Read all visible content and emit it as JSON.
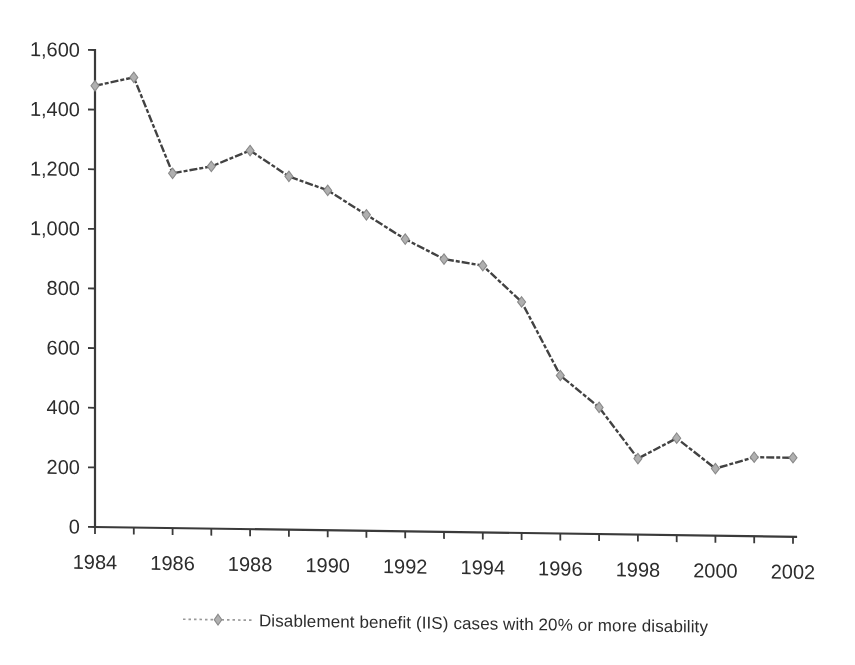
{
  "chart_data": {
    "type": "line",
    "x": [
      1984,
      1985,
      1986,
      1987,
      1988,
      1989,
      1990,
      1991,
      1992,
      1993,
      1994,
      1995,
      1996,
      1997,
      1998,
      1999,
      2000,
      2001,
      2002
    ],
    "series": [
      {
        "name": "Disablement benefit (IIS) cases with 20% or more disability",
        "values": [
          1480,
          1510,
          1190,
          1215,
          1270,
          1185,
          1140,
          1060,
          980,
          915,
          895,
          775,
          530,
          425,
          255,
          325,
          225,
          265,
          265
        ]
      }
    ],
    "xlabel": "",
    "ylabel": "",
    "ylim": [
      0,
      1600
    ],
    "xlim": [
      1984,
      2002
    ],
    "yticks": {
      "values": [
        0,
        200,
        400,
        600,
        800,
        1000,
        1200,
        1400,
        1600
      ],
      "labels": [
        "0",
        "200",
        "400",
        "600",
        "800",
        "1,000",
        "1,200",
        "1,400",
        "1,600"
      ]
    },
    "xtick_labels": [
      "1984",
      "1986",
      "1988",
      "1990",
      "1992",
      "1994",
      "1996",
      "1998",
      "2000",
      "2002"
    ],
    "grid": false,
    "legend_position": "bottom-center",
    "marker": "diamond",
    "line_style": "dash-dot",
    "colors": {
      "background": "#ffffff",
      "text": "#2d2d2d",
      "axis": "#3a3a3a",
      "line": "#424242",
      "marker_fill": "#b0b0b0",
      "marker_stroke": "#8a8a8a",
      "legend_line": "#9a9a9a"
    }
  }
}
